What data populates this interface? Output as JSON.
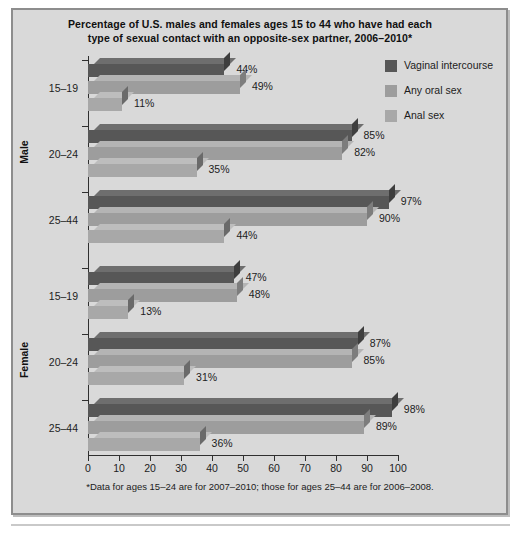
{
  "chart_data": {
    "type": "bar",
    "orientation": "horizontal",
    "title": "Percentage of U.S. males and females ages 15 to 44 who have had each type of sexual contact with an opposite-sex partner, 2006–2010*",
    "title_line1": "Percentage of U.S. males and females ages 15 to 44 who have had each",
    "title_line2": "type of sexual contact with an opposite-sex partner, 2006–2010*",
    "xlabel": "",
    "ylabel": "",
    "xlim": [
      0,
      100
    ],
    "xticks": [
      0,
      10,
      20,
      30,
      40,
      50,
      60,
      70,
      80,
      90,
      100
    ],
    "xtick_labels": [
      "0",
      "10",
      "20",
      "30",
      "40",
      "50",
      "60",
      "70",
      "80",
      "90",
      "100"
    ],
    "grid": false,
    "legend_position": "top-right",
    "legend": [
      "Vaginal intercourse",
      "Any oral sex",
      "Anal sex"
    ],
    "series": [
      {
        "name": "Vaginal intercourse",
        "color": "#575757",
        "values": [
          44,
          85,
          97,
          47,
          87,
          98
        ]
      },
      {
        "name": "Any oral sex",
        "color": "#9d9d9d",
        "values": [
          49,
          82,
          90,
          48,
          85,
          89
        ]
      },
      {
        "name": "Anal sex",
        "color": "#a8a8a8",
        "values": [
          11,
          35,
          44,
          13,
          31,
          36
        ]
      }
    ],
    "panels": [
      {
        "label": "Male",
        "categories": [
          "15–19",
          "20–24",
          "25–44"
        ],
        "groups": [
          {
            "category": "15–19",
            "bars": [
              {
                "series": "Vaginal intercourse",
                "value": 44,
                "label": "44%"
              },
              {
                "series": "Any oral sex",
                "value": 49,
                "label": "49%"
              },
              {
                "series": "Anal sex",
                "value": 11,
                "label": "11%"
              }
            ]
          },
          {
            "category": "20–24",
            "bars": [
              {
                "series": "Vaginal intercourse",
                "value": 85,
                "label": "85%"
              },
              {
                "series": "Any oral sex",
                "value": 82,
                "label": "82%"
              },
              {
                "series": "Anal sex",
                "value": 35,
                "label": "35%"
              }
            ]
          },
          {
            "category": "25–44",
            "bars": [
              {
                "series": "Vaginal intercourse",
                "value": 97,
                "label": "97%"
              },
              {
                "series": "Any oral sex",
                "value": 90,
                "label": "90%"
              },
              {
                "series": "Anal sex",
                "value": 44,
                "label": "44%"
              }
            ]
          }
        ]
      },
      {
        "label": "Female",
        "categories": [
          "15–19",
          "20–24",
          "25–44"
        ],
        "groups": [
          {
            "category": "15–19",
            "bars": [
              {
                "series": "Vaginal intercourse",
                "value": 47,
                "label": "47%"
              },
              {
                "series": "Any oral sex",
                "value": 48,
                "label": "48%"
              },
              {
                "series": "Anal sex",
                "value": 13,
                "label": "13%"
              }
            ]
          },
          {
            "category": "20–24",
            "bars": [
              {
                "series": "Vaginal intercourse",
                "value": 87,
                "label": "87%"
              },
              {
                "series": "Any oral sex",
                "value": 85,
                "label": "85%"
              },
              {
                "series": "Anal sex",
                "value": 31,
                "label": "31%"
              }
            ]
          },
          {
            "category": "25–44",
            "bars": [
              {
                "series": "Vaginal intercourse",
                "value": 98,
                "label": "98%"
              },
              {
                "series": "Any oral sex",
                "value": 89,
                "label": "89%"
              },
              {
                "series": "Anal sex",
                "value": 36,
                "label": "36%"
              }
            ]
          }
        ]
      }
    ],
    "footnote": "*Data for ages 15–24 are for 2007–2010; those for ages 25–44 are for 2006–2008.",
    "colors": {
      "background": "#d9d9d9",
      "frame_border": "#8d8d8d",
      "axis": "#2f2f2f",
      "text": "#1c1c1c",
      "series_vaginal": "#575757",
      "series_oral": "#9d9d9d",
      "series_anal": "#a8a8a8"
    }
  }
}
